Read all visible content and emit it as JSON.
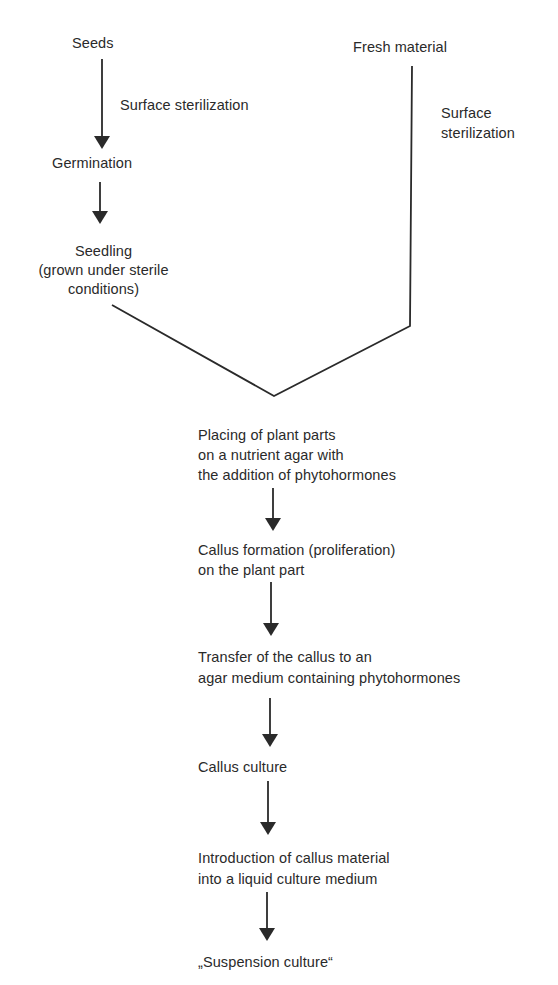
{
  "left_branch": {
    "start": "Seeds",
    "step1_label": "Surface sterilization",
    "step2": "Germination",
    "step3": [
      "Seedling",
      "(grown under sterile",
      "conditions)"
    ]
  },
  "right_branch": {
    "start": "Fresh material",
    "step1_label": [
      "Surface",
      "sterilization"
    ]
  },
  "main_flow": [
    {
      "lines": [
        "Placing of plant parts",
        "on a nutrient agar with",
        "the addition of phytohormones"
      ]
    },
    {
      "lines": [
        "Callus formation (proliferation)",
        "on the plant part"
      ]
    },
    {
      "lines": [
        "Transfer of the callus to an",
        "agar medium containing phytohormones"
      ]
    },
    {
      "lines": [
        "Callus culture"
      ]
    },
    {
      "lines": [
        "Introduction of callus material",
        "into a liquid culture medium"
      ]
    },
    {
      "lines": [
        "„Suspension culture“"
      ]
    }
  ],
  "colors": {
    "ink": "#2a2a2a",
    "background": "#ffffff"
  }
}
